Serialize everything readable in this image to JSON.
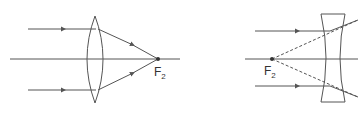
{
  "diagram": {
    "left": {
      "type": "converging-lens",
      "focal_label": "F",
      "focal_subscript": "2"
    },
    "right": {
      "type": "diverging-lens",
      "focal_label": "F",
      "focal_subscript": "2"
    }
  },
  "colors": {
    "stroke": "#555555",
    "text": "#333333",
    "background": "#ffffff"
  }
}
